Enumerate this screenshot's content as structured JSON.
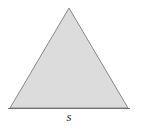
{
  "figure": {
    "type": "geometry-diagram",
    "shape_name": "equilateral-triangle",
    "background_color": "#ffffff",
    "canvas": {
      "width": 141,
      "height": 129
    },
    "triangle": {
      "fill_color": "#dcdcdc",
      "stroke_color": "#888888",
      "stroke_width": 1,
      "vertices": [
        {
          "name": "apex",
          "x": 69,
          "y": 8
        },
        {
          "name": "bottom-right",
          "x": 128,
          "y": 108
        },
        {
          "name": "bottom-left",
          "x": 10,
          "y": 108
        }
      ]
    },
    "baseline": {
      "stroke_color": "#707070",
      "stroke_width": 1,
      "x1": 8,
      "y1": 108,
      "x2": 130,
      "y2": 108
    },
    "labels": {
      "base_side": "s"
    }
  }
}
